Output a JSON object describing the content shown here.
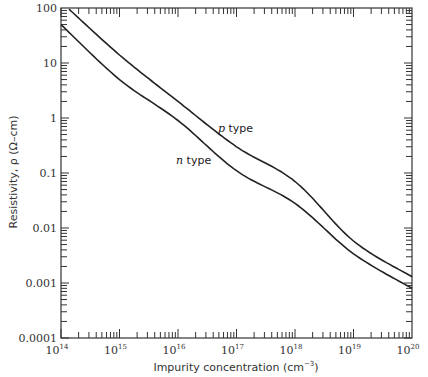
{
  "chart_data": {
    "type": "line",
    "title": "",
    "xlabel": "Impurity concentration (cm⁻³)",
    "ylabel": "Resistivity, ρ (Ω-cm)",
    "xscale": "log",
    "yscale": "log",
    "xlim": [
      100000000000000.0,
      1e+20
    ],
    "ylim": [
      0.0001,
      100
    ],
    "x_tick_labels": [
      "10^14",
      "10^15",
      "10^16",
      "10^17",
      "10^18",
      "10^19",
      "10^20"
    ],
    "y_tick_labels": [
      "100",
      "10",
      "1",
      "0.1",
      "0.01",
      "0.001",
      "0.0001"
    ],
    "grid": false,
    "legend": "inline curve labels",
    "x": [
      100000000000000.0,
      1000000000000000.0,
      1e+16,
      1e+17,
      1e+18,
      1e+19,
      1e+20
    ],
    "series": [
      {
        "name": "p type",
        "values": [
          130,
          14,
          2.0,
          0.3,
          0.07,
          0.0058,
          0.0013
        ]
      },
      {
        "name": "n type",
        "values": [
          50,
          5.0,
          0.9,
          0.11,
          0.028,
          0.0034,
          0.0008
        ]
      }
    ],
    "annotations": [
      "p type",
      "n type"
    ]
  },
  "labels": {
    "xlabel_text": "Impurity concentration ",
    "xlabel_unit": "(cm",
    "xlabel_exp": "−3",
    "xlabel_close": ")",
    "ylabel_text": "Resistivity, ρ (Ω–cm)",
    "p_label_italic": "p",
    "p_label_rest": " type",
    "n_label_italic": "n",
    "n_label_rest": " type",
    "yticks": [
      "100",
      "10",
      "1",
      "0.1",
      "0.01",
      "0.001",
      "0.0001"
    ],
    "xtick_base": "10",
    "xtick_exps": [
      "14",
      "15",
      "16",
      "17",
      "18",
      "19",
      "20"
    ]
  }
}
